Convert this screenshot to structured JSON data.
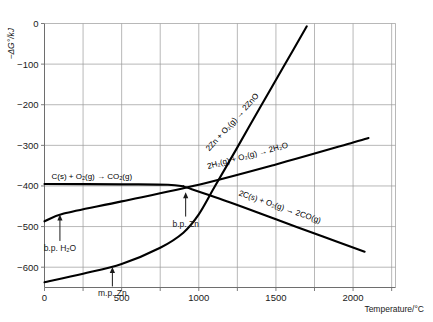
{
  "chart_data": {
    "type": "line",
    "title": "",
    "xlabel": "Temperature/°C",
    "ylabel": "−ΔG°/kJ",
    "xlim": [
      0,
      2275
    ],
    "ylim": [
      -650,
      0
    ],
    "grid": true,
    "legend_position": "inline-curve-labels",
    "x_ticks": [
      0,
      500,
      1000,
      1500,
      2000
    ],
    "x_tick_labels": [
      "0",
      "500",
      "1000",
      "1500",
      "2000"
    ],
    "x_minor_ticks": [
      250,
      750,
      1250,
      1750,
      2250
    ],
    "y_ticks": [
      0,
      -100,
      -200,
      -300,
      -400,
      -500,
      -600
    ],
    "y_tick_labels": [
      "0",
      "−100",
      "−200",
      "−300",
      "−400",
      "−500",
      "−600"
    ],
    "series": [
      {
        "name": "zinc-oxidation",
        "label": "2Zn + O₂(g) → 2ZnO",
        "label_rotation": -48,
        "points": [
          [
            0,
            -637
          ],
          [
            250,
            -616
          ],
          [
            500,
            -592
          ],
          [
            750,
            -552
          ],
          [
            900,
            -515
          ],
          [
            1000,
            -470
          ],
          [
            1100,
            -404
          ],
          [
            1250,
            -305
          ],
          [
            1400,
            -205
          ],
          [
            1550,
            -106
          ],
          [
            1700,
            -7
          ]
        ]
      },
      {
        "name": "hydrogen-oxidation",
        "label": "2H₂(g) + O₂(g) → 2H₂O",
        "label_rotation": -15,
        "points": [
          [
            0,
            -487
          ],
          [
            125,
            -468
          ],
          [
            500,
            -438
          ],
          [
            1000,
            -397
          ],
          [
            1500,
            -347
          ],
          [
            2000,
            -293
          ],
          [
            2100,
            -282
          ]
        ]
      },
      {
        "name": "carbon-to-carbon-dioxide",
        "label": "C(s) + O₂(g) → CO₂(g)",
        "label_rotation": 0,
        "points": [
          [
            0,
            -395
          ],
          [
            500,
            -396
          ],
          [
            800,
            -397
          ],
          [
            900,
            -401
          ]
        ]
      },
      {
        "name": "carbon-to-carbon-monoxide",
        "label": "2C(s) + O₂(g) → 2CO(g)",
        "label_rotation": 19,
        "points": [
          [
            900,
            -401
          ],
          [
            1200,
            -440
          ],
          [
            1500,
            -482
          ],
          [
            1800,
            -524
          ],
          [
            2075,
            -562
          ]
        ]
      }
    ],
    "annotations": [
      {
        "name": "bp-water",
        "text": "b.p. H₂O",
        "x": 100,
        "y": -468,
        "label_x": 100,
        "label_y": -560
      },
      {
        "name": "mp-zinc",
        "text": "m.p. Zn",
        "x": 440,
        "y": -597,
        "label_x": 440,
        "label_y": -672
      },
      {
        "name": "bp-zinc",
        "text": "b.p. Zn",
        "x": 915,
        "y": -413,
        "label_x": 915,
        "label_y": -500
      }
    ]
  },
  "colors": {
    "curve": "#000000",
    "grid": "#9a9a9a",
    "axis": "#6e6e6e",
    "text": "#1a1a1a",
    "background": "#ffffff"
  }
}
